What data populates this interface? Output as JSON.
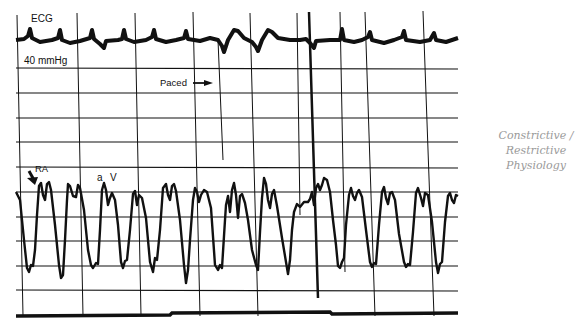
{
  "figure": {
    "labels": {
      "ecg": "ECG",
      "scale": "40 mmHg",
      "paced": "Paced",
      "ra": "RA",
      "a_wave": "a",
      "v_wave": "V"
    },
    "annotation": {
      "line1": "Constrictive /",
      "line2": "Restrictive",
      "line3": "Physiology"
    },
    "icons": {
      "paced_arrow": "right-arrow",
      "ra_arrow": "down-arrow"
    },
    "colors": {
      "ink": "#111111",
      "annotation": "#9a9a9a",
      "paper": "#ffffff"
    }
  }
}
